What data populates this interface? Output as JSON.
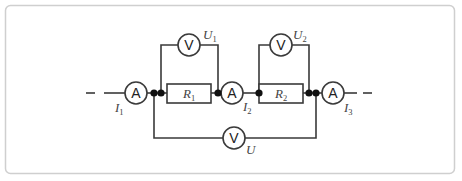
{
  "diagram": {
    "type": "circuit",
    "colors": {
      "wire": "#3a3a3a",
      "node": "#111111",
      "frame": "#cfcfcf",
      "label": "#444444"
    },
    "ammeters": [
      {
        "id": "A1",
        "symbol": "A",
        "label": "I",
        "sub": "1"
      },
      {
        "id": "A2",
        "symbol": "A",
        "label": "I",
        "sub": "2"
      },
      {
        "id": "A3",
        "symbol": "A",
        "label": "I",
        "sub": "3"
      }
    ],
    "voltmeters": [
      {
        "id": "V1",
        "symbol": "V",
        "label": "U",
        "sub": "1"
      },
      {
        "id": "V2",
        "symbol": "V",
        "label": "U",
        "sub": "2"
      },
      {
        "id": "V",
        "symbol": "V",
        "label": "U",
        "sub": ""
      }
    ],
    "resistors": [
      {
        "id": "R1",
        "label": "R",
        "sub": "1"
      },
      {
        "id": "R2",
        "label": "R",
        "sub": "2"
      }
    ]
  }
}
